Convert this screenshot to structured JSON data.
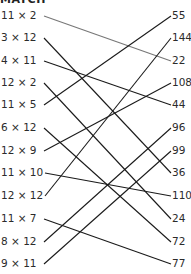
{
  "title": "MATCH",
  "left_items": [
    {
      "label": "11 × 2",
      "y": 15
    },
    {
      "label": "3 × 12",
      "y": 37
    },
    {
      "label": "4 × 11",
      "y": 60
    },
    {
      "label": "12 × 2",
      "y": 82
    },
    {
      "label": "11 × 5",
      "y": 104
    },
    {
      "label": "6 × 12",
      "y": 127
    },
    {
      "label": "12 × 9",
      "y": 150
    },
    {
      "label": "11 × 10",
      "y": 172
    },
    {
      "label": "12 × 12",
      "y": 195
    },
    {
      "label": "11 × 7",
      "y": 218
    },
    {
      "label": "8 × 12",
      "y": 241
    },
    {
      "label": "9 × 11",
      "y": 263
    }
  ],
  "right_items": [
    {
      "label": "55",
      "y": 15
    },
    {
      "label": "144",
      "y": 37
    },
    {
      "label": "22",
      "y": 60
    },
    {
      "label": "108",
      "y": 82
    },
    {
      "label": "44",
      "y": 104
    },
    {
      "label": "96",
      "y": 127
    },
    {
      "label": "99",
      "y": 150
    },
    {
      "label": "36",
      "y": 172
    },
    {
      "label": "110",
      "y": 195
    },
    {
      "label": "24",
      "y": 218
    },
    {
      "label": "72",
      "y": 241
    },
    {
      "label": "77",
      "y": 263
    }
  ],
  "connections": [
    {
      "from": 0,
      "to": 2,
      "color": "#777777"
    },
    {
      "from": 1,
      "to": 7,
      "color": "#1a1a1a"
    },
    {
      "from": 2,
      "to": 4,
      "color": "#1a1a1a"
    },
    {
      "from": 3,
      "to": 9,
      "color": "#1a1a1a"
    },
    {
      "from": 4,
      "to": 0,
      "color": "#1a1a1a"
    },
    {
      "from": 5,
      "to": 10,
      "color": "#1a1a1a"
    },
    {
      "from": 6,
      "to": 3,
      "color": "#1a1a1a"
    },
    {
      "from": 7,
      "to": 8,
      "color": "#1a1a1a"
    },
    {
      "from": 8,
      "to": 1,
      "color": "#1a1a1a"
    },
    {
      "from": 9,
      "to": 11,
      "color": "#1a1a1a"
    },
    {
      "from": 10,
      "to": 5,
      "color": "#1a1a1a"
    },
    {
      "from": 11,
      "to": 6,
      "color": "#1a1a1a"
    }
  ]
}
